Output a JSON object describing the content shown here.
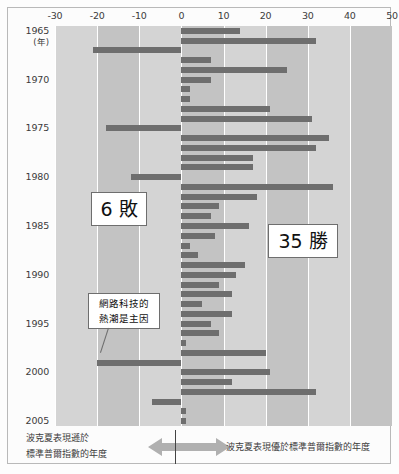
{
  "chart_data": {
    "type": "bar",
    "orientation": "horizontal",
    "title": "",
    "xlabel": "(%)",
    "ylabel": "",
    "unit_label": "(%)",
    "year_axis_note": "(年)",
    "xlim": [
      -30,
      50
    ],
    "xticks": [
      -30,
      -20,
      -10,
      0,
      10,
      20,
      30,
      40,
      50
    ],
    "xtick_labels": [
      "-30",
      "-20",
      "-10",
      "0",
      "10",
      "20",
      "30",
      "40",
      "50"
    ],
    "grid": true,
    "zero_line": 0,
    "year_labels": [
      "1965",
      "1970",
      "1975",
      "1980",
      "1985",
      "1990",
      "1995",
      "2000",
      "2005"
    ],
    "categories": [
      "1965",
      "1966",
      "1967",
      "1968",
      "1969",
      "1970",
      "1971",
      "1972",
      "1973",
      "1974",
      "1975",
      "1976",
      "1977",
      "1978",
      "1979",
      "1980",
      "1981",
      "1982",
      "1983",
      "1984",
      "1985",
      "1986",
      "1987",
      "1988",
      "1989",
      "1990",
      "1991",
      "1992",
      "1993",
      "1994",
      "1995",
      "1996",
      "1997",
      "1998",
      "1999",
      "2000",
      "2001",
      "2002",
      "2003",
      "2004",
      "2005"
    ],
    "values": [
      14,
      32,
      -21,
      7,
      25,
      7,
      2,
      2,
      21,
      31,
      -18,
      35,
      32,
      17,
      17,
      -12,
      36,
      18,
      9,
      7,
      16,
      8,
      2,
      4,
      15,
      13,
      9,
      12,
      5,
      12,
      7,
      9,
      1,
      20,
      -20,
      21,
      12,
      32,
      -7,
      1,
      1
    ],
    "series_name": "波克夏相對標準普爾指數的年度報酬差距",
    "legend_position": "bottom",
    "bar_color": "#6e6e6e",
    "plot_background": "#cfcfcf",
    "band_color": "#c3c3c3",
    "gridline_color": "#ffffff"
  },
  "axis": {
    "unit": "(%)",
    "ticks": [
      "-30",
      "-20",
      "-10",
      "0",
      "10",
      "20",
      "30",
      "40",
      "50"
    ],
    "year_unit": "(年)"
  },
  "annotations": {
    "losses_badge": "6 敗",
    "wins_badge": "35 勝",
    "note_line1": "網路科技的",
    "note_line2": "熱潮是主因"
  },
  "legend": {
    "left_line1": "波克夏表現遜於",
    "left_line2": "標準普爾指數的年度",
    "right_text": "波克夏表現優於標準普爾指數的年度",
    "arrow_left_name": "left-arrow",
    "arrow_right_name": "right-arrow"
  },
  "colors": {
    "bar": "#6e6e6e",
    "plot_bg": "#cfcfcf",
    "band": "#c3c3c3",
    "grid": "#ffffff",
    "text": "#3b3b3b",
    "arrow": "#b0b0b0"
  }
}
